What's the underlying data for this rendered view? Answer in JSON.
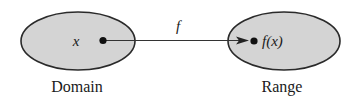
{
  "diagram": {
    "type": "function-mapping",
    "domain": {
      "label": "Domain",
      "element": "x",
      "fill": "#d4d4d4",
      "stroke": "#2a2a2a"
    },
    "range": {
      "label": "Range",
      "element": "f(x)",
      "fill": "#d4d4d4",
      "stroke": "#2a2a2a"
    },
    "mapping": {
      "label": "f",
      "color": "#333333"
    }
  }
}
